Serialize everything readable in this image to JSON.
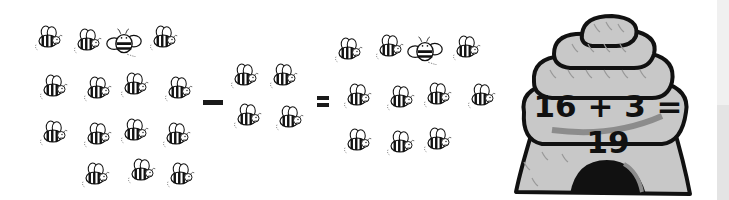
{
  "equation": {
    "text": "16 + 3 = 19",
    "minus_symbol": "−",
    "equals_symbol": "="
  },
  "groups": {
    "left": {
      "count": 15,
      "rows": [
        4,
        4,
        4,
        3
      ]
    },
    "middle": {
      "count": 4,
      "rows": [
        2,
        2
      ]
    },
    "right": {
      "count": 11,
      "rows": [
        4,
        4,
        3
      ]
    }
  },
  "icons": {
    "bee": "bee-icon",
    "beehive": "beehive-icon"
  },
  "colors": {
    "background": "#ffffff",
    "hive_fill": "#c8c8c8",
    "hive_shadow": "#8c8c8c",
    "outline": "#111111",
    "side_strip_top": "#f0f0f0",
    "side_strip_bottom": "#e4e4e4"
  }
}
